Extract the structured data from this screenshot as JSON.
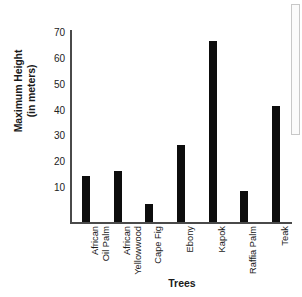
{
  "chart_data": {
    "type": "bar",
    "title": "",
    "xlabel": "Trees",
    "ylabel": "Maximum Height (in meters)",
    "ylabel_line1": "Maximum Height",
    "ylabel_line2": "(in meters)",
    "categories": [
      "African Oil Palm",
      "African Yellowwood",
      "Cape Fig",
      "Ebony",
      "Kapok",
      "Raffia Palm",
      "Teak"
    ],
    "category_lines": [
      [
        "African",
        "Oil Palm"
      ],
      [
        "African",
        "Yellowwood"
      ],
      [
        "Cape Fig"
      ],
      [
        "Ebony"
      ],
      [
        "Kapok"
      ],
      [
        "Raffia Palm"
      ],
      [
        "Teak"
      ]
    ],
    "values": [
      18,
      20,
      7,
      30,
      70,
      12,
      45
    ],
    "ylim": [
      0,
      75
    ],
    "yticks": [
      10,
      20,
      30,
      40,
      50,
      60,
      70
    ],
    "grid": false,
    "legend": false,
    "bar_color": "#0d0d0d",
    "axis_color": "#4a4a4a",
    "background": "#ffffff"
  },
  "scrollbar": {
    "name": "vertical-scrollbar"
  }
}
